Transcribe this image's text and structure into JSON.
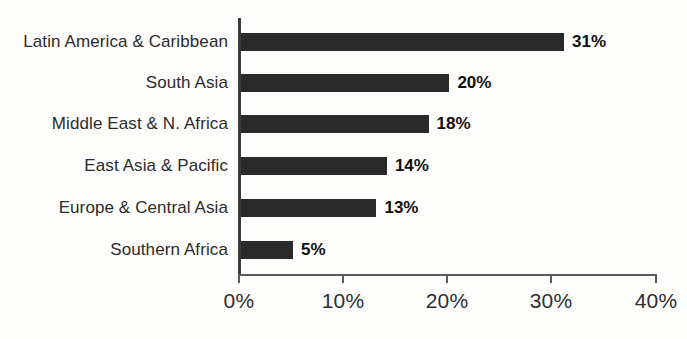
{
  "chart_data": {
    "type": "bar",
    "orientation": "horizontal",
    "title": "",
    "subtitle": "",
    "xlabel": "",
    "ylabel": "",
    "xlim": [
      0,
      40
    ],
    "xticks": [
      "0%",
      "10%",
      "20%",
      "30%",
      "40%"
    ],
    "xtick_values": [
      0,
      10,
      20,
      30,
      40
    ],
    "grid": false,
    "legend": false,
    "unit": "%",
    "bar_color": "#2a2a2a",
    "axis_color": "#3a3a3a",
    "label_color": "#2b2b2b",
    "categories": [
      "Latin America & Caribbean",
      "South Asia",
      "Middle East & N. Africa",
      "East Asia & Pacific",
      "Europe & Central Asia",
      "Southern Africa"
    ],
    "values": [
      31,
      20,
      18,
      14,
      13,
      5
    ],
    "value_labels": [
      "31%",
      "20%",
      "18%",
      "14%",
      "13%",
      "5%"
    ],
    "bars": [
      {
        "category": "Latin America & Caribbean",
        "value": 31,
        "label": "31%"
      },
      {
        "category": "South Asia",
        "value": 20,
        "label": "20%"
      },
      {
        "category": "Middle East & N. Africa",
        "value": 18,
        "label": "18%"
      },
      {
        "category": "East Asia & Pacific",
        "value": 14,
        "label": "14%"
      },
      {
        "category": "Europe & Central Asia",
        "value": 13,
        "label": "13%"
      },
      {
        "category": "Southern Africa",
        "value": 5,
        "label": "5%"
      }
    ]
  }
}
